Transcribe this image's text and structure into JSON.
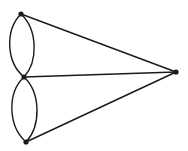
{
  "diagram": {
    "type": "multigraph",
    "background": "#ffffff",
    "stroke_color": "#1a1a1a",
    "nodes": [
      {
        "id": "A",
        "x": 21,
        "y": 14
      },
      {
        "id": "B",
        "x": 24,
        "y": 77
      },
      {
        "id": "C",
        "x": 26,
        "y": 142
      },
      {
        "id": "D",
        "x": 176,
        "y": 72
      }
    ],
    "edges": [
      {
        "from": "A",
        "to": "B",
        "kind": "arc-left"
      },
      {
        "from": "A",
        "to": "B",
        "kind": "arc-right"
      },
      {
        "from": "B",
        "to": "C",
        "kind": "arc-left"
      },
      {
        "from": "B",
        "to": "C",
        "kind": "arc-right"
      },
      {
        "from": "A",
        "to": "D",
        "kind": "straight"
      },
      {
        "from": "B",
        "to": "D",
        "kind": "straight"
      },
      {
        "from": "C",
        "to": "D",
        "kind": "straight"
      }
    ]
  }
}
